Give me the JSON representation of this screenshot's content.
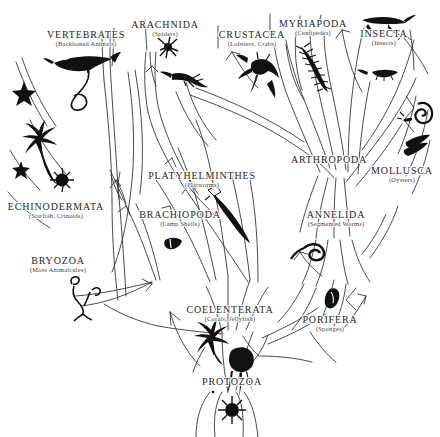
{
  "figure": {
    "type": "phylogenetic-tree-diagram",
    "background_color": "#ffffff",
    "ink_color": "#262626",
    "width": 440,
    "height": 437
  },
  "taxa": [
    {
      "id": "vertebrates",
      "name": "VERTEBRATES",
      "common": "(Backboned Animals)",
      "x": 86,
      "y": 30,
      "icon": "fish-icon"
    },
    {
      "id": "arachnida",
      "name": "ARACHNIDA",
      "common": "(Spiders)",
      "x": 165,
      "y": 20,
      "icon": "spider-icon"
    },
    {
      "id": "crustacea",
      "name": "CRUSTACEA",
      "common": "(Lobsters, Crabs)",
      "x": 252,
      "y": 30,
      "icon": "lobster-icon"
    },
    {
      "id": "myriapoda",
      "name": "MYRIAPODA",
      "common": "(Centipedes)",
      "x": 313,
      "y": 19,
      "icon": "centipede-icon"
    },
    {
      "id": "insecta",
      "name": "INSECTA",
      "common": "(Insects)",
      "x": 384,
      "y": 29,
      "icon": "grasshopper-icon"
    },
    {
      "id": "mollusca",
      "name": "MOLLUSCA",
      "common": "(Oysters)",
      "x": 402,
      "y": 166,
      "icon": "snail-icon"
    },
    {
      "id": "arthropoda",
      "name": "ARTHROPODA",
      "common": "",
      "x": 329,
      "y": 155,
      "icon": ""
    },
    {
      "id": "annelida",
      "name": "ANNELIDA",
      "common": "(Segmented Worms)",
      "x": 336,
      "y": 210,
      "icon": "segmented-worm-icon"
    },
    {
      "id": "platyhelminthes",
      "name": "PLATYHELMINTHES",
      "common": "(Flatworms)",
      "x": 202,
      "y": 171,
      "icon": "flatworm-icon"
    },
    {
      "id": "brachiopoda",
      "name": "BRACHIOPODA",
      "common": "(Lamp Shells)",
      "x": 180,
      "y": 210,
      "icon": "lamp-shell-icon"
    },
    {
      "id": "echinodermata",
      "name": "ECHINODERMATA",
      "common": "(Starfish, Crinoids)",
      "x": 56,
      "y": 202,
      "icon": "starfish-icon"
    },
    {
      "id": "bryozoa",
      "name": "BRYOZOA",
      "common": "(Moss Animalcules)",
      "x": 58,
      "y": 256,
      "icon": "bryozoan-icon"
    },
    {
      "id": "coelenterata",
      "name": "COELENTERATA",
      "common": "(Corals, Jellyfish)",
      "x": 230,
      "y": 305,
      "icon": "jellyfish-icon"
    },
    {
      "id": "porifera",
      "name": "PORIFERA",
      "common": "(Sponges)",
      "x": 330,
      "y": 315,
      "icon": "sponge-icon"
    },
    {
      "id": "protozoa",
      "name": "PROTOZOA",
      "common": "",
      "x": 232,
      "y": 377,
      "icon": "protozoan-icon"
    }
  ]
}
